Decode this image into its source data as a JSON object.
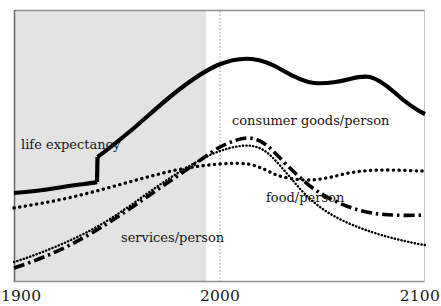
{
  "chart_data": {
    "type": "line",
    "title": "",
    "subtitle": "",
    "xlabel": "",
    "ylabel": "",
    "xlim": [
      1900,
      2100
    ],
    "ylim": [
      0,
      100
    ],
    "grid": false,
    "legend_position": "inline-annotations",
    "x_ticks": [
      "1900",
      "2000",
      "2100"
    ],
    "x_tick_values": [
      1900,
      2000,
      2100
    ],
    "y_ticks": [],
    "annotations": [
      {
        "text": "life expectancy",
        "x": 1910,
        "y": 53,
        "series": "life expectancy"
      },
      {
        "text": "consumer goods/person",
        "x": 2002,
        "y": 63,
        "series": "consumer goods/person"
      },
      {
        "text": "food/person",
        "x": 2018,
        "y": 36,
        "series": "food/person"
      },
      {
        "text": "services/person",
        "x": 1948,
        "y": 22,
        "series": "services/person"
      }
    ],
    "shaded_region": {
      "label": "historical period",
      "x_start": 1900,
      "x_end": 1993,
      "color": "#e3e3e3"
    },
    "reference_line": {
      "label": "2000",
      "x": 2000,
      "style": "dotted",
      "color": "#9a9a9a"
    },
    "series": [
      {
        "name": "life expectancy",
        "line_style": "solid",
        "color": "#000000",
        "x": [
          1900,
          1910,
          1920,
          1930,
          1938,
          1939,
          1945,
          1955,
          1965,
          1975,
          1985,
          1995,
          2005,
          2015,
          2025,
          2035,
          2045,
          2055,
          2065,
          2075,
          2085,
          2095,
          2100
        ],
        "values": [
          33,
          34,
          35,
          36,
          38,
          47,
          50,
          55,
          61,
          68,
          74,
          80,
          86,
          90,
          92,
          90,
          87,
          85,
          85,
          86,
          85,
          77,
          68
        ]
      },
      {
        "name": "food/person",
        "line_style": "dotted-coarse",
        "color": "#000000",
        "x": [
          1900,
          1915,
          1930,
          1945,
          1960,
          1975,
          1990,
          2000,
          2010,
          2020,
          2030,
          2040,
          2050,
          2060,
          2070,
          2080,
          2090,
          2100
        ],
        "values": [
          28,
          30,
          33,
          37,
          41,
          45,
          50,
          52,
          53,
          51,
          47,
          43,
          42,
          44,
          47,
          49,
          50,
          50
        ]
      },
      {
        "name": "consumer goods/person",
        "line_style": "dash-dot",
        "color": "#000000",
        "x": [
          1900,
          1915,
          1930,
          1945,
          1960,
          1975,
          1990,
          2000,
          2008,
          2016,
          2025,
          2035,
          2045,
          2055,
          2065,
          2075,
          2085,
          2095,
          2100
        ],
        "values": [
          8,
          12,
          17,
          23,
          30,
          38,
          47,
          54,
          59,
          61,
          59,
          55,
          49,
          43,
          38,
          33,
          29,
          26,
          25
        ]
      },
      {
        "name": "services/person",
        "line_style": "dotted-fine",
        "color": "#000000",
        "x": [
          1900,
          1915,
          1930,
          1945,
          1960,
          1975,
          1990,
          2000,
          2010,
          2020,
          2030,
          2040,
          2050,
          2060,
          2070,
          2080,
          2090,
          2100
        ],
        "values": [
          10,
          13,
          17,
          21,
          26,
          32,
          40,
          46,
          52,
          55,
          54,
          50,
          45,
          40,
          35,
          31,
          28,
          26
        ]
      }
    ]
  },
  "axis": {
    "tick_1900": "1900",
    "tick_2000": "2000",
    "tick_2100": "2100"
  },
  "labels": {
    "life_expectancy": "life expectancy",
    "consumer_goods": "consumer goods/person",
    "food": "food/person",
    "services": "services/person"
  },
  "colors": {
    "shaded_region": "#e3e3e3",
    "plot_border": "#8a8a8a",
    "gridline": "#9a9a9a",
    "line": "#000000",
    "background": "#ffffff",
    "text": "#161616"
  }
}
